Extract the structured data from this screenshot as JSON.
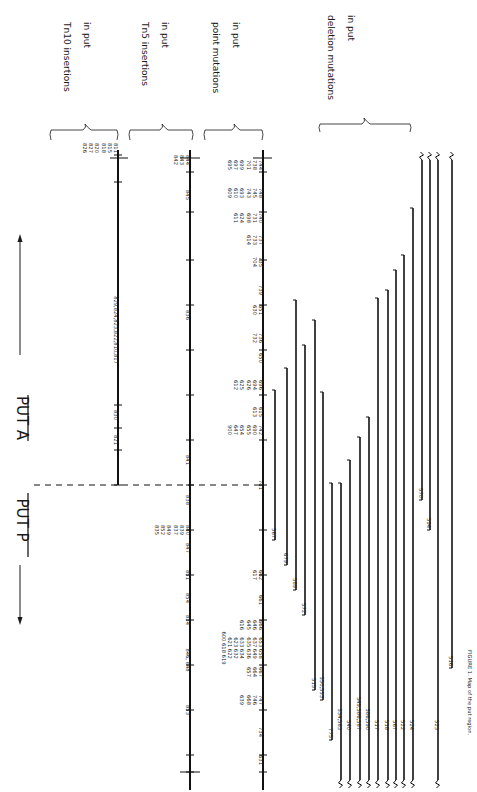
{
  "figure": {
    "orientation": "rotated-90-clockwise",
    "title_genes": [
      "PUT P",
      "PUT A"
    ],
    "direction_arrow": "bidirectional",
    "caption_visible": "FIGURE 1. Map of the put region (partially visible, cut off at right edge)"
  },
  "sections": [
    {
      "id": "tn10",
      "header_line1": "Tn10 insertions",
      "header_line2": "in put",
      "underline_word": "10"
    },
    {
      "id": "tn5",
      "header_line1": "Tn5 insertions",
      "header_line2": "in put",
      "underline_word": "5"
    },
    {
      "id": "point",
      "header_line1": "point mutations",
      "header_line2": "in put"
    },
    {
      "id": "deletion",
      "header_line1": "deletion mutations",
      "header_line2": "in put"
    }
  ],
  "tn10": {
    "line": {
      "x": 118,
      "y1": 150,
      "y2": 485
    },
    "ticks": [
      155,
      182,
      405,
      428,
      450,
      485
    ],
    "labels": [
      {
        "y": 148,
        "lines": [
          "826",
          "827",
          "820",
          "818",
          "815",
          "811"
        ]
      },
      {
        "y": 330,
        "lines": [
          "829,824,823,822,810,817"
        ]
      },
      {
        "y": 415,
        "lines": [
          "830"
        ]
      },
      {
        "y": 440,
        "lines": [
          "821"
        ]
      }
    ]
  },
  "tn5": {
    "line": {
      "x": 190,
      "y1": 150,
      "y2": 790
    },
    "ticks": [
      172,
      212,
      260,
      305,
      350,
      395,
      440,
      485,
      530,
      575,
      620,
      665,
      710,
      755,
      772
    ],
    "labels": [
      {
        "y": 160,
        "lines": [
          "842",
          "843",
          "844"
        ]
      },
      {
        "y": 195,
        "lines": [
          "845"
        ]
      },
      {
        "y": 315,
        "lines": [
          "836"
        ]
      },
      {
        "y": 460,
        "lines": [
          "841"
        ]
      },
      {
        "y": 500,
        "lines": [
          "838"
        ]
      },
      {
        "y": 530,
        "lines": [
          "835",
          "852",
          "849",
          "837",
          "839",
          "840"
        ]
      },
      {
        "y": 548,
        "lines": [
          "847"
        ]
      },
      {
        "y": 575,
        "lines": [
          "851"
        ]
      },
      {
        "y": 598,
        "lines": [
          "854"
        ]
      },
      {
        "y": 620,
        "lines": [
          "834"
        ]
      },
      {
        "y": 660,
        "lines": [
          "846, 848"
        ]
      },
      {
        "y": 710,
        "lines": [
          "853"
        ]
      }
    ]
  },
  "point": {
    "line": {
      "x": 263,
      "y1": 150,
      "y2": 790
    },
    "ticks": [
      172,
      212,
      260,
      305,
      350,
      395,
      440,
      485,
      530,
      575,
      620,
      665,
      710,
      755,
      772
    ],
    "labels": [
      {
        "y": 165,
        "lines": [
          "695",
          "697",
          "699",
          "701",
          "738",
          "744"
        ]
      },
      {
        "y": 193,
        "lines": [
          "609",
          "610",
          "693",
          "743",
          "745",
          "748"
        ]
      },
      {
        "y": 218,
        "lines": [
          "611",
          "624",
          "698",
          "731",
          "740"
        ]
      },
      {
        "y": 240,
        "lines": [
          "614",
          "733",
          "737"
        ]
      },
      {
        "y": 262,
        "lines": [
          "704",
          "735"
        ]
      },
      {
        "y": 290,
        "lines": [
          "739"
        ]
      },
      {
        "y": 310,
        "lines": [
          "630",
          "651"
        ]
      },
      {
        "y": 338,
        "lines": [
          "732",
          "736"
        ]
      },
      {
        "y": 358,
        "lines": [
          "650"
        ]
      },
      {
        "y": 385,
        "lines": [
          "612",
          "625",
          "626",
          "694",
          "696"
        ]
      },
      {
        "y": 412,
        "lines": [
          "613",
          "615"
        ]
      },
      {
        "y": 430,
        "lines": [
          "900",
          "647",
          "654",
          "655",
          "690",
          "742"
        ]
      },
      {
        "y": 485,
        "lines": [
          "741"
        ]
      },
      {
        "y": 575,
        "lines": [
          "617",
          "662"
        ]
      },
      {
        "y": 600,
        "lines": [
          "661"
        ]
      },
      {
        "y": 625,
        "lines": [
          "616",
          "645",
          "646",
          "666"
        ]
      },
      {
        "y": 648,
        "lines": [
          "600 618 619",
          "621 622",
          "623 632",
          "633 634",
          "635 636",
          "637 649",
          "653 658"
        ]
      },
      {
        "y": 672,
        "lines": [
          "657",
          "664",
          "667"
        ]
      },
      {
        "y": 700,
        "lines": [
          "639",
          "668",
          "746",
          "747"
        ]
      },
      {
        "y": 732,
        "lines": [
          "734"
        ]
      },
      {
        "y": 760,
        "lines": [
          "631"
        ]
      }
    ]
  },
  "dashed_boundary": {
    "y": 485,
    "x1": 34,
    "x2": 265
  },
  "deletions": [
    {
      "x": 275,
      "y_top": 390,
      "y_bot": 540,
      "label": "567",
      "left_wavy": false,
      "right_wavy": false
    },
    {
      "x": 287,
      "y_top": 368,
      "y_bot": 565,
      "label": "679",
      "left_wavy": false,
      "right_wavy": false
    },
    {
      "x": 296,
      "y_top": 300,
      "y_bot": 590,
      "label": "589",
      "left_wavy": false,
      "right_wavy": false
    },
    {
      "x": 305,
      "y_top": 345,
      "y_bot": 615,
      "label": "572",
      "left_wavy": false,
      "right_wavy": false
    },
    {
      "x": 315,
      "y_top": 320,
      "y_bot": 690,
      "label": "515",
      "left_wavy": false,
      "right_wavy": false
    },
    {
      "x": 323,
      "y_top": 392,
      "y_bot": 700,
      "label": "550,553",
      "left_wavy": false,
      "right_wavy": false
    },
    {
      "x": 332,
      "y_top": 483,
      "y_bot": 740,
      "label": "775",
      "left_wavy": false,
      "right_wavy": false
    },
    {
      "x": 341,
      "y_top": 483,
      "y_bot": 780,
      "label": "534,583",
      "left_wavy": false,
      "right_wavy": true
    },
    {
      "x": 350,
      "y_top": 460,
      "y_bot": 780,
      "label": "540",
      "left_wavy": false,
      "right_wavy": true
    },
    {
      "x": 360,
      "y_top": 437,
      "y_bot": 780,
      "label": "549,586,587",
      "left_wavy": false,
      "right_wavy": true
    },
    {
      "x": 369,
      "y_top": 417,
      "y_bot": 780,
      "label": "586,590",
      "left_wavy": false,
      "right_wavy": true
    },
    {
      "x": 378,
      "y_top": 298,
      "y_bot": 780,
      "label": "517",
      "left_wavy": false,
      "right_wavy": true
    },
    {
      "x": 388,
      "y_top": 290,
      "y_bot": 780,
      "label": "518",
      "left_wavy": false,
      "right_wavy": true
    },
    {
      "x": 396,
      "y_top": 270,
      "y_bot": 780,
      "label": "567",
      "left_wavy": false,
      "right_wavy": true
    },
    {
      "x": 404,
      "y_top": 255,
      "y_bot": 780,
      "label": "522",
      "left_wavy": false,
      "right_wavy": true
    },
    {
      "x": 413,
      "y_top": 208,
      "y_bot": 780,
      "label": "524",
      "left_wavy": false,
      "right_wavy": true
    },
    {
      "x": 422,
      "y_top": 160,
      "y_bot": 500,
      "label": "570",
      "left_wavy": true,
      "right_wavy": false
    },
    {
      "x": 430,
      "y_top": 160,
      "y_bot": 530,
      "label": "594",
      "left_wavy": true,
      "right_wavy": false
    },
    {
      "x": 438,
      "y_top": 160,
      "y_bot": 780,
      "label": "523",
      "left_wavy": true,
      "right_wavy": true
    },
    {
      "x": 452,
      "y_top": 160,
      "y_bot": 668,
      "label": "516",
      "left_wavy": true,
      "right_wavy": false
    }
  ],
  "caption": {
    "text": "FIGURE 1. Map of the put region."
  }
}
